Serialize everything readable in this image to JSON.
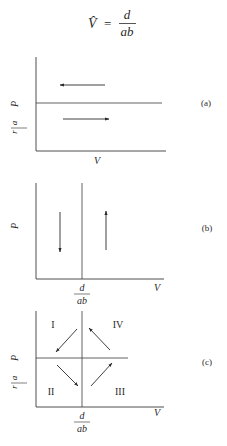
{
  "equation": {
    "lhs": "V̂",
    "equals": "=",
    "numerator": "d",
    "denominator": "ab"
  },
  "panels": [
    {
      "id": "a",
      "label": "(a)",
      "x_axis_label": "V",
      "y_axis_label": "P",
      "y_tick": {
        "numerator": "r",
        "denominator": "a"
      },
      "x_tick": null,
      "description": "Horizontal line P = r/a; arrow pointing left above line, arrow pointing right below line"
    },
    {
      "id": "b",
      "label": "(b)",
      "x_axis_label": "V",
      "y_axis_label": "P",
      "y_tick": null,
      "x_tick": {
        "numerator": "d",
        "denominator": "ab"
      },
      "description": "Vertical line V = d/ab; arrow pointing down left of line, arrow pointing up right of line"
    },
    {
      "id": "c",
      "label": "(c)",
      "x_axis_label": "V",
      "y_axis_label": "P",
      "y_tick": {
        "numerator": "r",
        "denominator": "a"
      },
      "x_tick": {
        "numerator": "d",
        "denominator": "ab"
      },
      "quadrants": [
        "I",
        "II",
        "III",
        "IV"
      ],
      "description": "Phase diagram with four quadrants and counter-clockwise cycling arrows: I→II→III→IV"
    }
  ]
}
